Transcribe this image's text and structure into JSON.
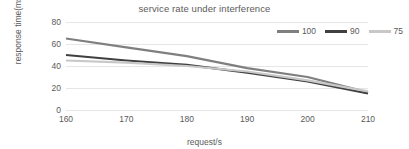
{
  "chart_data": {
    "type": "line",
    "title": "service rate under interference",
    "xlabel": "request/s",
    "ylabel": "response time(ms)",
    "x": [
      160,
      170,
      180,
      190,
      200,
      210
    ],
    "xticks": [
      "160",
      "170",
      "180",
      "190",
      "200",
      "210"
    ],
    "yticks": [
      "0",
      "20",
      "40",
      "60",
      "80"
    ],
    "ytick_values": [
      0,
      20,
      40,
      60,
      80
    ],
    "xlim": [
      160,
      210
    ],
    "ylim": [
      0,
      80
    ],
    "grid": "horizontal",
    "legend_position": "top-right",
    "series": [
      {
        "name": "100",
        "color": "#7f7f7f",
        "values": [
          65,
          57,
          49,
          38,
          30,
          16
        ]
      },
      {
        "name": "90",
        "color": "#404040",
        "values": [
          50,
          45,
          41,
          34,
          26,
          15
        ]
      },
      {
        "name": "75",
        "color": "#c8c8c8",
        "values": [
          45,
          43,
          40,
          35,
          27,
          17
        ]
      }
    ]
  }
}
